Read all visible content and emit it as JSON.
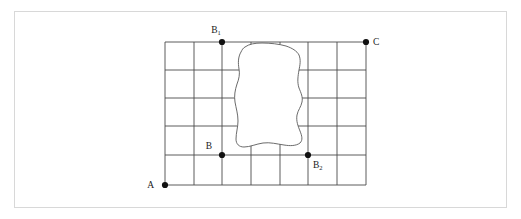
{
  "figure": {
    "title": "",
    "background_color": "#ffffff",
    "frame_color": "#d8d8d8",
    "grid_line_color": "#4a4a4a",
    "blob_fill_color": "#ffffff",
    "blob_stroke_color": "#5a5a5a",
    "dot_color": "#111111"
  },
  "grid": {
    "columns": 7,
    "rows": 5,
    "left": 165,
    "right": 366,
    "top": 42,
    "bottom": 185,
    "vertical_x": [
      165,
      194,
      222,
      251,
      280,
      308,
      337,
      366
    ],
    "horizontal_y": [
      42,
      70,
      98,
      126,
      155,
      185
    ]
  },
  "points": [
    {
      "id": "A",
      "label": "A",
      "sub": "",
      "x": 165,
      "y": 185,
      "label_x": 154,
      "label_y": 188,
      "label_anchor": "end"
    },
    {
      "id": "B1",
      "label": "B",
      "sub": "1",
      "x": 222,
      "y": 42,
      "label_x": 216,
      "label_y": 33,
      "label_anchor": "middle"
    },
    {
      "id": "B",
      "label": "B",
      "sub": "",
      "x": 222,
      "y": 155,
      "label_x": 212,
      "label_y": 149,
      "label_anchor": "end"
    },
    {
      "id": "B2",
      "label": "B",
      "sub": "2",
      "x": 308,
      "y": 155,
      "label_x": 313,
      "label_y": 168,
      "label_anchor": "start"
    },
    {
      "id": "C",
      "label": "C",
      "sub": "",
      "x": 366,
      "y": 42,
      "label_x": 373,
      "label_y": 45,
      "label_anchor": "start"
    }
  ],
  "blob": {
    "name": "irregular-obstacle-region",
    "path": "M 245 47 C 249 44 255 43 262 43 C 270 43 279 44 286 46 C 292 48 297 51 299 55 C 301 60 300 65 299 70 C 298 76 297 82 299 88 C 301 93 303 97 302 102 C 301 107 298 110 297 115 C 296 121 298 126 300 131 C 302 136 303 140 300 143 C 296 146 290 146 284 145 C 277 144 270 142 263 143 C 256 144 250 147 244 147 C 239 147 236 144 236 139 C 236 133 238 127 238 121 C 238 114 236 108 235 102 C 234 96 235 90 237 84 C 239 79 240 74 239 69 C 238 63 238 57 241 52 C 242 50 243 48 245 47 Z"
  }
}
